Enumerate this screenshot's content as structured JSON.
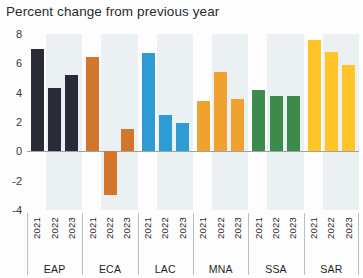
{
  "chart_data": {
    "type": "bar",
    "title": "Percent change from previous year",
    "xlabel": "",
    "ylabel": "",
    "ylim": [
      -4,
      8
    ],
    "yticks": [
      8,
      6,
      4,
      2,
      0,
      -2,
      -4
    ],
    "grid": false,
    "legend": "none",
    "categories": [
      "2021",
      "2022",
      "2023"
    ],
    "groups": [
      {
        "name": "EAP",
        "color": "#2b2b38",
        "values": [
          7.0,
          4.3,
          5.2
        ]
      },
      {
        "name": "ECA",
        "color": "#d2762c",
        "values": [
          6.4,
          -3.0,
          1.5
        ]
      },
      {
        "name": "LAC",
        "color": "#2e9bd4",
        "values": [
          6.7,
          2.5,
          1.9
        ]
      },
      {
        "name": "MNA",
        "color": "#f0a22e",
        "values": [
          3.4,
          5.4,
          3.6
        ]
      },
      {
        "name": "SSA",
        "color": "#3c8b4c",
        "values": [
          4.2,
          3.8,
          3.8
        ]
      },
      {
        "name": "SAR",
        "color": "#ffc527",
        "values": [
          7.6,
          6.8,
          5.9
        ]
      }
    ]
  },
  "axis": {
    "tick_labels": [
      "8",
      "6",
      "4",
      "2",
      "0",
      "-2",
      "-4"
    ]
  },
  "colors": {
    "band": "#e3ecee",
    "zero_line": "#9aa3a6",
    "text": "#1f1f1f"
  }
}
